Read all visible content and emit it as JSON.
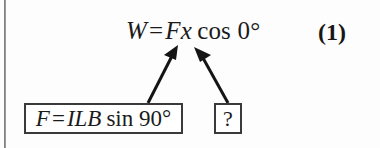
{
  "figure": {
    "equation": {
      "work_symbol": "W",
      "equals": "=",
      "force_symbol": "F",
      "distance_symbol": "x",
      "function": "cos",
      "angle": "0°",
      "full_text": "W = Fx cos 0°"
    },
    "equation_number": "(1)",
    "boxes": [
      {
        "id": "force-expression",
        "text": "F = ILB sin 90°",
        "force_symbol": "F",
        "equals": "=",
        "current_length_field": "ILB",
        "function": "sin",
        "angle": "90°"
      },
      {
        "id": "unknown",
        "text": "?"
      }
    ],
    "arrows": [
      {
        "id": "force-to-equation",
        "from": "force-expression",
        "to": "equation"
      },
      {
        "id": "unknown-to-equation",
        "from": "unknown",
        "to": "equation"
      }
    ],
    "colors": {
      "ink": "#1b1b1b",
      "box_border": "#3a3a3a",
      "background": "#fdfdfd",
      "scan_line": "#6f6f6f"
    }
  }
}
